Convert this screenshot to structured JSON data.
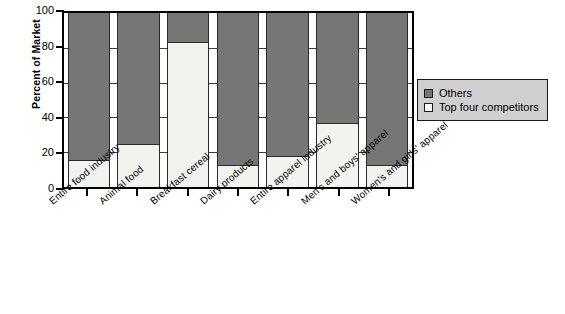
{
  "chart_data": {
    "type": "bar",
    "subtype": "stacked-bar-100-percent",
    "title": "",
    "xlabel": "",
    "ylabel": "Percent of Market",
    "ylim": [
      0,
      100
    ],
    "yticks": [
      0,
      20,
      40,
      60,
      80,
      100
    ],
    "grid": true,
    "legend_position": "right",
    "categories": [
      "Entire food industry",
      "Animal food",
      "Breakfast cereal",
      "Dairy products",
      "Entire apparel industry",
      "Men's and boys' apparel",
      "Women's and girls' apparel"
    ],
    "series": [
      {
        "name": "Top four competitors",
        "color": "#f2f2ee",
        "values": [
          15,
          24,
          83,
          12,
          17,
          36,
          12
        ]
      },
      {
        "name": "Others",
        "color": "#767676",
        "values": [
          85,
          76,
          17,
          88,
          83,
          64,
          88
        ]
      }
    ]
  },
  "axis": {
    "y_title": "Percent of Market",
    "y_tick_labels": [
      "100",
      "80",
      "60",
      "40",
      "20",
      "0"
    ]
  },
  "legend": {
    "items": [
      {
        "label": "Others",
        "color": "#767676"
      },
      {
        "label": "Top four competitors",
        "color": "#ffffff"
      }
    ]
  }
}
